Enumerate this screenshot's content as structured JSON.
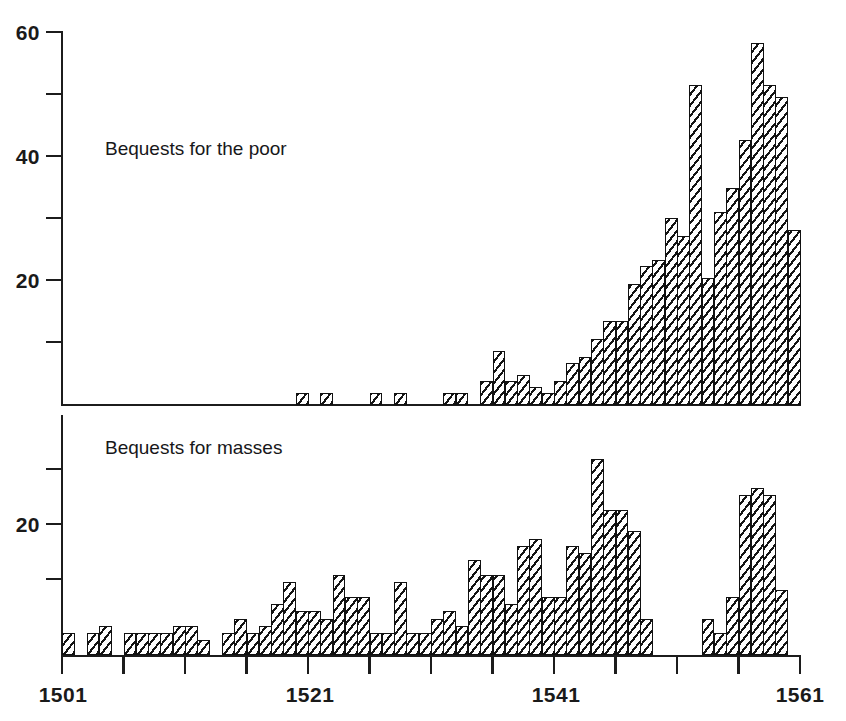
{
  "figure": {
    "background": "#ffffff",
    "ink_color": "#1a1a1a",
    "hatch_color": "#141414"
  },
  "labels": {
    "upper_series": "Bequests for the poor",
    "lower_series": "Bequests for masses"
  },
  "axes": {
    "x_tick_labels": [
      "1501",
      "1521",
      "1541",
      "1561"
    ],
    "x_minor_ticks": [
      1501,
      1506,
      1511,
      1516,
      1521,
      1526,
      1531,
      1536,
      1541,
      1546,
      1551,
      1556,
      1561
    ],
    "upper_y_tick_labels": [
      "60",
      "40",
      "20"
    ],
    "upper_y_minor_ticks": [
      10,
      20,
      30,
      40,
      50,
      60
    ],
    "lower_y_tick_labels": [
      "20"
    ],
    "lower_y_minor_ticks": [
      10,
      20,
      30
    ]
  },
  "chart_data": [
    {
      "type": "bar",
      "title": "Bequests for the poor",
      "xlabel": "",
      "ylabel": "",
      "xlim": [
        1501,
        1561
      ],
      "ylim": [
        0,
        62
      ],
      "grid": false,
      "legend": "none",
      "x": [
        1501,
        1502,
        1503,
        1504,
        1505,
        1506,
        1507,
        1508,
        1509,
        1510,
        1511,
        1512,
        1513,
        1514,
        1515,
        1516,
        1517,
        1518,
        1519,
        1520,
        1521,
        1522,
        1523,
        1524,
        1525,
        1526,
        1527,
        1528,
        1529,
        1530,
        1531,
        1532,
        1533,
        1534,
        1535,
        1536,
        1537,
        1538,
        1539,
        1540,
        1541,
        1542,
        1543,
        1544,
        1545,
        1546,
        1547,
        1548,
        1549,
        1550,
        1551,
        1552,
        1553,
        1554,
        1555,
        1556,
        1557,
        1558,
        1559,
        1560
      ],
      "values": [
        0,
        0,
        0,
        0,
        0,
        0,
        0,
        0,
        0,
        0,
        0,
        0,
        0,
        0,
        0,
        0,
        0,
        0,
        0,
        2,
        0,
        2,
        0,
        0,
        0,
        2,
        0,
        2,
        0,
        0,
        0,
        2,
        2,
        0,
        4,
        9,
        4,
        5,
        3,
        2,
        4,
        7,
        8,
        11,
        14,
        14,
        20,
        23,
        24,
        31,
        28,
        53,
        21,
        32,
        36,
        44,
        60,
        53,
        51,
        29
      ]
    },
    {
      "type": "bar",
      "title": "Bequests for masses",
      "xlabel": "",
      "ylabel": "",
      "xlim": [
        1501,
        1561
      ],
      "ylim": [
        0,
        33
      ],
      "grid": false,
      "legend": "none",
      "x": [
        1501,
        1502,
        1503,
        1504,
        1505,
        1506,
        1507,
        1508,
        1509,
        1510,
        1511,
        1512,
        1513,
        1514,
        1515,
        1516,
        1517,
        1518,
        1519,
        1520,
        1521,
        1522,
        1523,
        1524,
        1525,
        1526,
        1527,
        1528,
        1529,
        1530,
        1531,
        1532,
        1533,
        1534,
        1535,
        1536,
        1537,
        1538,
        1539,
        1540,
        1541,
        1542,
        1543,
        1544,
        1545,
        1546,
        1547,
        1548,
        1549,
        1550,
        1551,
        1552,
        1553,
        1554,
        1555,
        1556,
        1557,
        1558,
        1559,
        1560
      ],
      "values": [
        3,
        0,
        3,
        4,
        0,
        3,
        3,
        3,
        3,
        4,
        4,
        2,
        0,
        3,
        5,
        3,
        4,
        7,
        10,
        6,
        6,
        5,
        11,
        8,
        8,
        3,
        3,
        10,
        3,
        3,
        5,
        6,
        4,
        13,
        11,
        11,
        7,
        15,
        16,
        8,
        8,
        15,
        14,
        27,
        20,
        20,
        17,
        5,
        0,
        0,
        0,
        0,
        5,
        3,
        8,
        22,
        23,
        22,
        9,
        0
      ]
    }
  ]
}
